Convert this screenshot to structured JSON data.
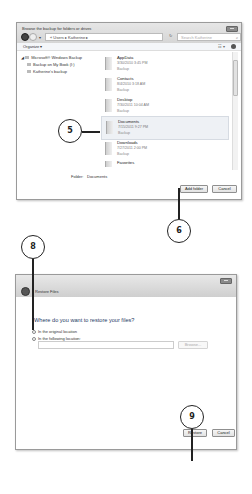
{
  "window1": {
    "title": "Browse the backup for folders or drives",
    "breadcrumb": [
      "Users",
      "Katherine"
    ],
    "address_text": "« Users ▸ Katherine ▸",
    "search_placeholder": "Search Katherine",
    "toolbar": {
      "organize_label": "Organize ▾"
    },
    "nav_tree": [
      {
        "label": "Microsoft® Windows Backup",
        "level": 0
      },
      {
        "label": "Backup on My Book (I:)",
        "level": 1
      },
      {
        "label": "Katherine's backup",
        "level": 1
      }
    ],
    "folders": [
      {
        "name": "AppData",
        "date": "3/30/2010 3:45 PM",
        "type": "Backup",
        "selected": false
      },
      {
        "name": "Contacts",
        "date": "8/4/2010 3:18 AM",
        "type": "Backup",
        "selected": false
      },
      {
        "name": "Desktop",
        "date": "7/30/2011 10:04 AM",
        "type": "Backup",
        "selected": false
      },
      {
        "name": "Documents",
        "date": "7/15/2011 9:27 PM",
        "type": "Backup",
        "selected": true
      },
      {
        "name": "Downloads",
        "date": "7/27/2011 2:00 PM",
        "type": "Backup",
        "selected": false
      },
      {
        "name": "Favorites",
        "date": "",
        "type": "",
        "selected": false
      }
    ],
    "folder_field": {
      "label": "Folder:",
      "value": "Documents"
    },
    "buttons": {
      "add_folder": "Add folder",
      "cancel": "Cancel"
    }
  },
  "window2": {
    "title": "Restore Files",
    "question": "Where do you want to restore your files?",
    "options": [
      {
        "label": "In the original location",
        "selected": true
      },
      {
        "label": "In the following location:",
        "selected": false
      }
    ],
    "location_value": "",
    "browse_label": "Browse...",
    "buttons": {
      "restore": "Restore",
      "cancel": "Cancel"
    }
  },
  "callouts": {
    "c5": "5",
    "c6": "6",
    "c8": "8",
    "c9": "9"
  }
}
